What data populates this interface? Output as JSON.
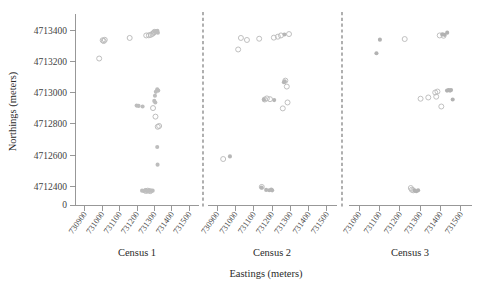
{
  "figure": {
    "background": "#ffffff",
    "y_axis_title": "Northings (meters)",
    "x_axis_title": "Eastings (meters)"
  },
  "chart_data": {
    "type": "scatter",
    "title": "",
    "xlabel": "Eastings (meters)",
    "ylabel": "Northings (meters)",
    "grid": false,
    "legend": false,
    "panels": [
      {
        "label": "Census 1",
        "xlim": [
          730850,
          731550
        ],
        "xticks": [
          730900,
          731000,
          731100,
          731200,
          731300,
          731400,
          731500
        ],
        "xtick_labels": [
          "730900",
          "731000",
          "731100",
          "731200",
          "731300",
          "731400",
          "731500"
        ],
        "series": [
          {
            "name": "open",
            "marker": "open-circle",
            "color": "#b9b9b9",
            "points": [
              [
                731003,
                4713337
              ],
              [
                731009,
                4713332
              ],
              [
                731015,
                4713340
              ],
              [
                730983,
                4713220
              ],
              [
                731158,
                4713352
              ],
              [
                731253,
                4713368
              ],
              [
                731268,
                4713369
              ],
              [
                731279,
                4713372
              ],
              [
                731288,
                4713378
              ],
              [
                731296,
                4713385
              ],
              [
                731300,
                4713391
              ],
              [
                731292,
                4712902
              ],
              [
                731306,
                4712847
              ],
              [
                731319,
                4712782
              ],
              [
                731327,
                4712787
              ],
              [
                731250,
                4712370
              ],
              [
                731262,
                4712372
              ],
              [
                731276,
                4712369
              ]
            ]
          },
          {
            "name": "filled",
            "marker": "filled-circle",
            "color": "#bdbdbd",
            "points": [
              [
                731301,
                4713392
              ],
              [
                731308,
                4713396
              ],
              [
                731313,
                4713390
              ],
              [
                731317,
                4713398
              ],
              [
                731320,
                4713385
              ],
              [
                731198,
                4712918
              ],
              [
                731209,
                4712916
              ],
              [
                731232,
                4712912
              ],
              [
                731303,
                4712981
              ],
              [
                731308,
                4713006
              ],
              [
                731316,
                4713022
              ],
              [
                731322,
                4713014
              ],
              [
                731299,
                4712948
              ],
              [
                731305,
                4712938
              ],
              [
                731316,
                4712652
              ],
              [
                731318,
                4712539
              ],
              [
                731229,
                4712372
              ],
              [
                731240,
                4712370
              ],
              [
                731248,
                4712374
              ],
              [
                731256,
                4712371
              ],
              [
                731268,
                4712373
              ],
              [
                731280,
                4712370
              ],
              [
                731290,
                4712372
              ]
            ]
          }
        ]
      },
      {
        "label": "Census 2",
        "xlim": [
          730850,
          731550
        ],
        "xticks": [
          730900,
          731000,
          731100,
          731200,
          731300,
          731400,
          731500
        ],
        "xtick_labels": [
          "730900",
          "731000",
          "731100",
          "731200",
          "731300",
          "731400",
          "731500"
        ],
        "series": [
          {
            "name": "open",
            "marker": "open-circle",
            "color": "#bcbcbc",
            "points": [
              [
                731030,
                4713352
              ],
              [
                731063,
                4713339
              ],
              [
                731015,
                4713278
              ],
              [
                731130,
                4713347
              ],
              [
                731210,
                4713354
              ],
              [
                731232,
                4713360
              ],
              [
                731249,
                4713368
              ],
              [
                731293,
                4713377
              ],
              [
                731273,
                4713078
              ],
              [
                731281,
                4713040
              ],
              [
                731160,
                4712957
              ],
              [
                731172,
                4712964
              ],
              [
                731189,
                4712959
              ],
              [
                731285,
                4712938
              ],
              [
                731259,
                4712900
              ],
              [
                730933,
                4712575
              ],
              [
                731144,
                4712396
              ]
            ]
          },
          {
            "name": "filled",
            "marker": "filled-circle",
            "color": "#b6b6b6",
            "points": [
              [
                731268,
                4713374
              ],
              [
                731265,
                4713068
              ],
              [
                731270,
                4713073
              ],
              [
                731212,
                4712953
              ],
              [
                731156,
                4712956
              ],
              [
                730970,
                4712592
              ],
              [
                731143,
                4712392
              ],
              [
                731168,
                4712377
              ],
              [
                731185,
                4712375
              ],
              [
                731196,
                4712379
              ],
              [
                731201,
                4712374
              ]
            ]
          }
        ]
      },
      {
        "label": "Census 3",
        "xlim": [
          730950,
          731550
        ],
        "xticks": [
          731000,
          731100,
          731200,
          731300,
          731400,
          731500
        ],
        "xtick_labels": [
          "731000",
          "731100",
          "731200",
          "731300",
          "731400",
          "731500"
        ],
        "series": [
          {
            "name": "open",
            "marker": "open-circle",
            "color": "#bdbdbd",
            "points": [
              [
                731224,
                4713345
              ],
              [
                731396,
                4713368
              ],
              [
                731415,
                4713366
              ],
              [
                731302,
                4712962
              ],
              [
                731340,
                4712970
              ],
              [
                731374,
                4713002
              ],
              [
                731385,
                4713008
              ],
              [
                731379,
                4712975
              ],
              [
                731404,
                4712912
              ],
              [
                731254,
                4712389
              ],
              [
                731259,
                4712378
              ],
              [
                731266,
                4712374
              ]
            ]
          },
          {
            "name": "filled",
            "marker": "filled-circle",
            "color": "#b2b2b2",
            "points": [
              [
                731102,
                4713341
              ],
              [
                731085,
                4713254
              ],
              [
                731409,
                4713375
              ],
              [
                731420,
                4713372
              ],
              [
                731433,
                4713386
              ],
              [
                731432,
                4713014
              ],
              [
                731440,
                4713017
              ],
              [
                731447,
                4713014
              ],
              [
                731452,
                4713018
              ],
              [
                731460,
                4712957
              ],
              [
                731272,
                4712373
              ],
              [
                731281,
                4712368
              ],
              [
                731290,
                4712374
              ]
            ]
          }
        ]
      }
    ],
    "ylim": [
      4712280,
      4713480
    ],
    "yticks": [
      4712400,
      4712600,
      4712800,
      4713000,
      4713200,
      4713400
    ],
    "ytick_labels": [
      "4712400",
      "4712600",
      "4712800",
      "4713000",
      "4713200",
      "4713400"
    ],
    "y_origin_label": "0"
  }
}
